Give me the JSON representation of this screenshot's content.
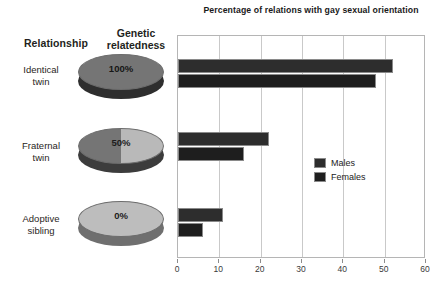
{
  "table": {
    "headers": {
      "relationship": "Relationship",
      "genetic_line1": "Genetic",
      "genetic_line2": "relatedness"
    },
    "rows": [
      {
        "label_line1": "Identical",
        "label_line2": "twin",
        "relatedness": "100%"
      },
      {
        "label_line1": "Fraternal",
        "label_line2": "twin",
        "relatedness": "50%"
      },
      {
        "label_line1": "Adoptive",
        "label_line2": "sibling",
        "relatedness": "0%"
      }
    ]
  },
  "legend": {
    "males": "Males",
    "females": "Females"
  },
  "chart_data": {
    "type": "bar",
    "orientation": "horizontal",
    "title": "Percentage of relations with gay sexual orientation",
    "xlabel": "",
    "ylabel": "",
    "categories": [
      "Identical twin",
      "Fraternal twin",
      "Adoptive sibling"
    ],
    "series": [
      {
        "name": "Males",
        "values": [
          52,
          22,
          11
        ],
        "color": "#2d2d2d"
      },
      {
        "name": "Females",
        "values": [
          48,
          16,
          6
        ],
        "color": "#1e1e1e"
      }
    ],
    "xlim": [
      0,
      60
    ],
    "xticks": [
      0,
      10,
      20,
      30,
      40,
      50,
      60
    ],
    "grid": true,
    "legend_position": "inside-right"
  }
}
